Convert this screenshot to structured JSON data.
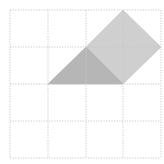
{
  "diagram": {
    "type": "grid-geometry",
    "grid": {
      "rows": 4,
      "cols": 4,
      "x_lines": [
        10,
        48,
        86,
        123,
        161
      ],
      "y_lines": [
        10,
        47,
        84,
        121,
        158
      ],
      "line_style": "dotted",
      "line_color": "#c8c8c8"
    },
    "shapes": [
      {
        "name": "light-quadrilateral",
        "grid_points": [
          [
            2,
            1
          ],
          [
            3,
            0
          ],
          [
            4,
            1
          ],
          [
            3,
            2
          ]
        ],
        "fill": "#cfcfcf"
      },
      {
        "name": "dark-triangle",
        "grid_points": [
          [
            1,
            2
          ],
          [
            2,
            1
          ],
          [
            3,
            2
          ]
        ],
        "fill": "#b6b6b6"
      }
    ]
  }
}
